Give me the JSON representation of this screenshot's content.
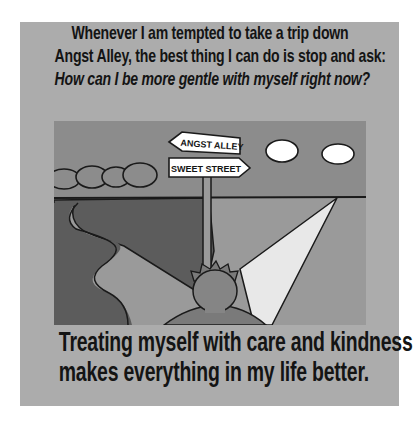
{
  "header": {
    "line1": "Whenever I am tempted to take a trip down",
    "line2": "Angst Alley, the best thing I can do is stop and ask:",
    "question": "How can I be more gentle with myself right now?"
  },
  "illustration": {
    "sign_top": "ANGST ALLEY",
    "sign_bottom": "SWEET STREET",
    "colors": {
      "sky": "#8c8c8c",
      "dark_field": "#5c5c5c",
      "light_field": "#9a9a9a",
      "path_bright": "#e8e8e8",
      "cloud": "#ffffff",
      "head": "#858585"
    }
  },
  "footer": {
    "line1": "Treating myself with care and kindness",
    "line2": "makes everything in my life better."
  }
}
